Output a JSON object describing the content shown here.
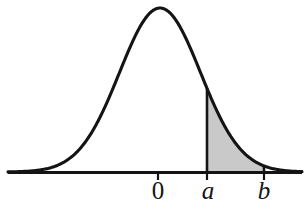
{
  "figure": {
    "kind": "normal-distribution-curve-with-shaded-area",
    "background_color": "#ffffff",
    "curve_color": "#111111",
    "axis_color": "#111111",
    "shade_color": "#c9c9c9",
    "shade_stroke_color": "#111111"
  },
  "axis": {
    "name": "horizontal-axis",
    "y_px": 172,
    "x_start_px": 8,
    "x_end_px": 302,
    "thickness_px": 3
  },
  "ticks": [
    {
      "id": "tick-zero",
      "label": "0",
      "x_px": 158,
      "italic": false
    },
    {
      "id": "tick-a",
      "label": "a",
      "x_px": 207,
      "italic": true
    },
    {
      "id": "tick-b",
      "label": "b",
      "x_px": 264,
      "italic": true
    }
  ],
  "labels": {
    "zero": "0",
    "a": "a",
    "b": "b"
  },
  "shaded_region": {
    "name": "area-between-a-and-b",
    "from_label": "a",
    "to_label": "b",
    "from_x_px": 207,
    "to_x_px": 264,
    "fill": "#c9c9c9"
  },
  "chart_data": {
    "type": "area",
    "title": "",
    "xlabel": "",
    "ylabel": "",
    "grid": false,
    "legend": null,
    "curve": "normal (bell) density",
    "x_tick_labels": [
      "0",
      "a",
      "b"
    ],
    "x_tick_values": [
      0,
      1.0,
      2.18
    ],
    "mean": 0,
    "peak_x_px": 160,
    "peak_y_px": 8,
    "baseline_y_px": 172,
    "shaded_interval": [
      "a",
      "b"
    ],
    "x_px": [
      8,
      20,
      34,
      48,
      62,
      76,
      90,
      104,
      118,
      132,
      146,
      160,
      174,
      188,
      202,
      216,
      230,
      244,
      258,
      272,
      286,
      300
    ],
    "y_px": [
      169,
      168,
      166,
      163,
      158,
      151,
      140,
      125,
      105,
      82,
      55,
      35,
      13,
      9,
      23,
      55,
      95,
      126,
      144,
      156,
      164,
      169
    ]
  }
}
